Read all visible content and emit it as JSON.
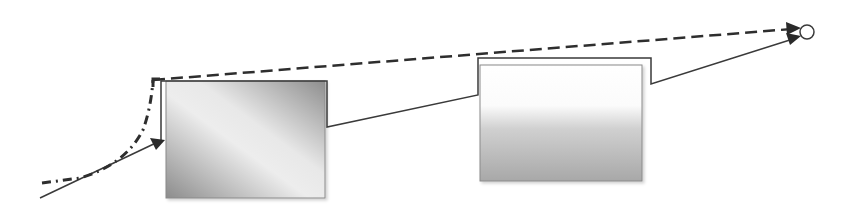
{
  "diagram": {
    "canvas": {
      "width": 847,
      "height": 211,
      "background": "#ffffff"
    },
    "colors": {
      "line": "#3a3a3a",
      "dashed": "#2e2e2e",
      "box_border": "#8a8a8a",
      "box1_dark": "#8c8c8c",
      "box1_light": "#f0f0f0",
      "box2_top": "#ffffff",
      "box2_bottom": "#a8a8a8"
    },
    "boxes": [
      {
        "id": "box-left",
        "x": 166,
        "y": 81,
        "w": 159,
        "h": 117,
        "fill": "diagonal-gradient"
      },
      {
        "id": "box-right",
        "x": 480,
        "y": 65,
        "w": 162,
        "h": 116,
        "fill": "vertical-gradient"
      }
    ],
    "paths": {
      "solid_flow": "M40,198 L164,140 M161,140 L161,81 L327,81 L327,127 L478,95 L478,58 L651,58 L651,84 L799,37",
      "dash_dot_curve": "M42,183 L80,178 Q125,165 143,130 Q152,105 153,80",
      "dashed_line": "M153,80 L799,28"
    },
    "arrowheads": [
      {
        "at": [
          164,
          140
        ],
        "angle": -25
      },
      {
        "at": [
          800,
          28
        ],
        "angle": -5
      },
      {
        "at": [
          800,
          37
        ],
        "angle": -18
      }
    ],
    "endpoint": {
      "cx": 807,
      "cy": 32,
      "r": 7
    }
  }
}
